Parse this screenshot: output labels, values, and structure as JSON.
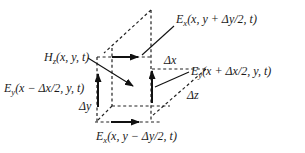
{
  "figure": {
    "background": "#ffffff",
    "line_color": "#1a1a1a",
    "labels": {
      "ex_top": {
        "main": "E",
        "sub": "x",
        "rest": "(x, y + Δy/2, t)"
      },
      "hz": {
        "main": "H",
        "sub": "z",
        "rest": "(x, y, t)"
      },
      "ey_left": {
        "main": "E",
        "sub": "y",
        "rest": "(x − Δx/2, y, t)"
      },
      "ey_right": {
        "main": "E",
        "sub": "y",
        "rest": "(x + Δx/2, y, t)"
      },
      "ex_bottom": {
        "main": "E",
        "sub": "x",
        "rest": "(x, y − Δy/2, t)"
      },
      "delta_x": "Δx",
      "delta_y": "Δy",
      "delta_z": "Δz"
    }
  }
}
